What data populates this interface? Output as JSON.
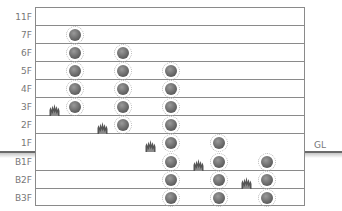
{
  "diagram": {
    "ground_label": "GL",
    "floors": [
      {
        "label": "11F",
        "top": 7
      },
      {
        "label": "7F",
        "top": 25
      },
      {
        "label": "6F",
        "top": 43
      },
      {
        "label": "5F",
        "top": 61
      },
      {
        "label": "4F",
        "top": 79
      },
      {
        "label": "3F",
        "top": 97
      },
      {
        "label": "2F",
        "top": 115
      },
      {
        "label": "1F",
        "top": 133
      },
      {
        "label": "B1F",
        "top": 152
      },
      {
        "label": "B2F",
        "top": 170
      },
      {
        "label": "B3F",
        "top": 188
      }
    ],
    "columns_x": [
      75,
      123,
      171,
      219,
      267
    ],
    "devices": [
      {
        "floor": "7F",
        "col": 0
      },
      {
        "floor": "6F",
        "col": 0
      },
      {
        "floor": "6F",
        "col": 1
      },
      {
        "floor": "5F",
        "col": 0
      },
      {
        "floor": "5F",
        "col": 1
      },
      {
        "floor": "5F",
        "col": 2
      },
      {
        "floor": "4F",
        "col": 0
      },
      {
        "floor": "4F",
        "col": 1
      },
      {
        "floor": "4F",
        "col": 2
      },
      {
        "floor": "3F",
        "col": 0
      },
      {
        "floor": "3F",
        "col": 1
      },
      {
        "floor": "3F",
        "col": 2
      },
      {
        "floor": "2F",
        "col": 1
      },
      {
        "floor": "2F",
        "col": 2
      },
      {
        "floor": "1F",
        "col": 2
      },
      {
        "floor": "1F",
        "col": 3
      },
      {
        "floor": "B1F",
        "col": 2
      },
      {
        "floor": "B1F",
        "col": 3
      },
      {
        "floor": "B1F",
        "col": 4
      },
      {
        "floor": "B2F",
        "col": 2
      },
      {
        "floor": "B2F",
        "col": 3
      },
      {
        "floor": "B2F",
        "col": 4
      },
      {
        "floor": "B3F",
        "col": 2
      },
      {
        "floor": "B3F",
        "col": 3
      },
      {
        "floor": "B3F",
        "col": 4
      }
    ],
    "fires": [
      {
        "floor": "3F",
        "col": 0
      },
      {
        "floor": "2F",
        "col": 1
      },
      {
        "floor": "1F",
        "col": 2
      },
      {
        "floor": "B1F",
        "col": 3
      },
      {
        "floor": "B2F",
        "col": 4
      }
    ],
    "icons": {
      "device": "smoke-detector-icon",
      "fire": "fire-icon"
    },
    "colors": {
      "grid": "#8a8a8a",
      "label": "#777777",
      "device": "#5e5e5e",
      "fire": "#555555"
    }
  }
}
